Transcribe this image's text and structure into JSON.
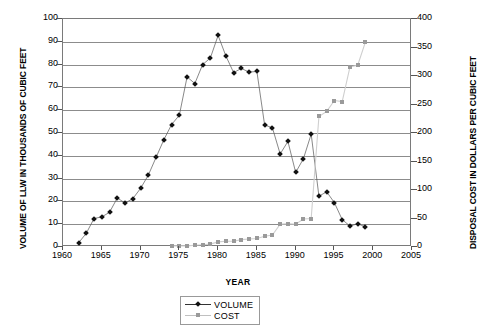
{
  "chart_data": {
    "type": "line",
    "title": "",
    "xlabel": "YEAR",
    "ylabel": "VOLUME OF LLW IN THOUSANDS OF CUBIC FEET",
    "y2label": "DISPOSAL COST IN DOLLARS PER CUBIC FEET",
    "xlim": [
      1960,
      2005
    ],
    "ylim": [
      0,
      100
    ],
    "y2lim": [
      0,
      400
    ],
    "xticks": [
      1960,
      1965,
      1970,
      1975,
      1980,
      1985,
      1990,
      1995,
      2000,
      2005
    ],
    "yticks": [
      0,
      10,
      20,
      30,
      40,
      50,
      60,
      70,
      80,
      90,
      100
    ],
    "y2ticks": [
      0,
      50,
      100,
      150,
      200,
      250,
      300,
      350,
      400
    ],
    "grid": true,
    "legend_position": "bottom-center",
    "series": [
      {
        "name": "VOLUME",
        "axis": "left",
        "color": "#111111",
        "marker": "diamond",
        "x": [
          1962,
          1963,
          1964,
          1965,
          1966,
          1967,
          1968,
          1969,
          1970,
          1971,
          1972,
          1973,
          1974,
          1975,
          1976,
          1977,
          1978,
          1979,
          1980,
          1981,
          1982,
          1983,
          1984,
          1985,
          1986,
          1987,
          1988,
          1989,
          1990,
          1991,
          1992,
          1993,
          1994,
          1995,
          1996,
          1997,
          1998,
          1999
        ],
        "values": [
          1.8,
          6.0,
          12.5,
          13.2,
          15.2,
          21.5,
          19.3,
          21.2,
          25.7,
          31.5,
          39.3,
          47.0,
          53.7,
          57.8,
          74.6,
          71.7,
          80.0,
          82.9,
          92.8,
          83.8,
          76.5,
          78.3,
          76.7,
          77.0,
          53.5,
          52.3,
          40.8,
          46.3,
          32.7,
          38.7,
          49.5,
          22.3,
          24.2,
          19.4,
          12.0,
          9.2,
          10.2,
          8.8
        ]
      },
      {
        "name": "COST",
        "axis": "right",
        "color": "#9a9a9a",
        "marker": "square",
        "x": [
          1974,
          1975,
          1976,
          1977,
          1978,
          1979,
          1980,
          1981,
          1982,
          1983,
          1984,
          1985,
          1986,
          1987,
          1988,
          1989,
          1990,
          1991,
          1992,
          1993,
          1994,
          1995,
          1996,
          1997,
          1998,
          1999
        ],
        "values": [
          2,
          2,
          2,
          3,
          4,
          5,
          9,
          10,
          10,
          13,
          14,
          15,
          19,
          21,
          40,
          41,
          40,
          49,
          50,
          229,
          238,
          257,
          255,
          316,
          319,
          360
        ]
      }
    ]
  },
  "legend": {
    "items": [
      {
        "label": "VOLUME"
      },
      {
        "label": "COST"
      }
    ]
  }
}
